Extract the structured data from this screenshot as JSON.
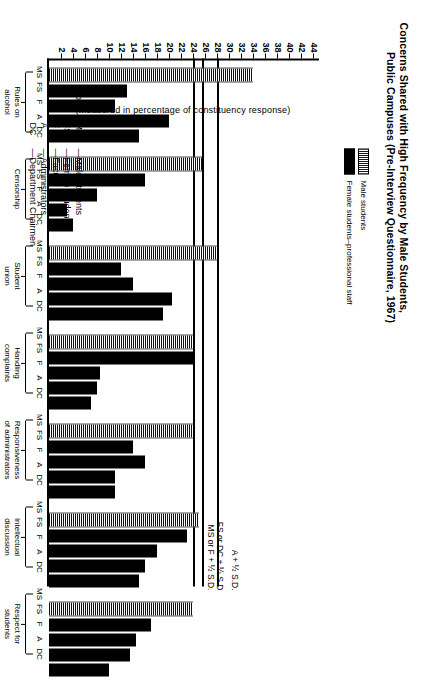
{
  "title": {
    "line1": "Concerns Shared with High Frequency by Male Students,",
    "line2": "Public Campuses (Pre-Interview Questionnaire, 1967)"
  },
  "legend": {
    "items": [
      {
        "label": "Male students",
        "pattern": "striped"
      },
      {
        "label": "Female students–professional staff",
        "pattern": "solid"
      }
    ]
  },
  "axis": {
    "caption": "(Measured in percentage of constituency response)",
    "ticks": [
      2,
      4,
      6,
      8,
      10,
      12,
      14,
      16,
      18,
      20,
      22,
      24,
      26,
      28,
      30,
      32,
      34,
      36,
      38,
      40,
      42,
      44
    ]
  },
  "reference_lines": [
    {
      "label": "MS or F + ½ S.D.",
      "value": 24
    },
    {
      "label": "FS or DC + ½ S.D",
      "value": 25.5
    },
    {
      "label": "A + ½ S.D.",
      "value": 28
    }
  ],
  "code_key": {
    "heading": "Code:",
    "entries": [
      {
        "abbr": "MS",
        "dash": "—",
        "name": "Male Students"
      },
      {
        "abbr": "FS",
        "dash": "—",
        "name": "Female Students"
      },
      {
        "abbr": "F",
        "dash": "—",
        "name": "Faculty"
      },
      {
        "abbr": "A",
        "dash": "—",
        "name": "Administrators"
      },
      {
        "abbr": "DC",
        "dash": "—",
        "name": "Department Chairmen"
      }
    ]
  },
  "chart_data": {
    "type": "bar",
    "title": "Concerns Shared with High Frequency by Male Students, Public Campuses (Pre-Interview Questionnaire, 1967)",
    "xlabel": "",
    "ylabel": "(Measured in percentage of constituency response)",
    "ylim": [
      0,
      45
    ],
    "grid": false,
    "legend_position": "top-left",
    "constituencies": [
      "MS",
      "FS",
      "F",
      "A",
      "DC"
    ],
    "categories": [
      "Rules on alcohol",
      "Censorship",
      "Student union",
      "Handling complaints",
      "Responsiveness of administrators",
      "Intellectual discussion",
      "Respect for students"
    ],
    "groups": [
      {
        "name": "Rules on\nalcohol",
        "name_line1": "Rules on",
        "name_line2": "alcohol",
        "codes": [
          "MS",
          "FS",
          "F",
          "A",
          "DC"
        ],
        "values": [
          34,
          13,
          11,
          20,
          15
        ]
      },
      {
        "name": "Censorship",
        "name_line1": "Censorship",
        "name_line2": "",
        "codes": [
          "MS",
          "FS",
          "F",
          "A",
          "DC"
        ],
        "values": [
          25.5,
          16,
          8,
          3,
          4
        ]
      },
      {
        "name": "Student\nunion",
        "name_line1": "Student",
        "name_line2": "union",
        "codes": [
          "MS",
          "FS",
          "F",
          "A",
          "DC"
        ],
        "values": [
          28,
          12,
          14,
          20.5,
          19
        ]
      },
      {
        "name": "Handling\ncomplaints",
        "name_line1": "Handling",
        "name_line2": "complaints",
        "codes": [
          "MS",
          "FS",
          "F",
          "A",
          "DC"
        ],
        "values": [
          24,
          24,
          8.5,
          8,
          7
        ]
      },
      {
        "name": "Responsiveness\nof administrators",
        "name_line1": "Responsiveness",
        "name_line2": "of administrators",
        "codes": [
          "MS",
          "FS",
          "F",
          "A",
          "DC"
        ],
        "values": [
          24,
          14,
          16,
          11,
          11
        ]
      },
      {
        "name": "Intellectual\ndiscussion",
        "name_line1": "Intellectual",
        "name_line2": "discussion",
        "codes": [
          "MS",
          "FS",
          "F",
          "A",
          "DC"
        ],
        "values": [
          25,
          23,
          18,
          16,
          15
        ]
      },
      {
        "name": "Respect for\nstudents",
        "name_line1": "Respect for",
        "name_line2": "students",
        "codes": [
          "MS",
          "FS",
          "F",
          "A",
          "DC"
        ],
        "values": [
          24,
          17,
          14.5,
          13.5,
          10
        ]
      }
    ],
    "reference_lines": [
      {
        "label": "MS or F + ½ S.D.",
        "value": 24
      },
      {
        "label": "FS or DC + ½ S.D",
        "value": 25.5
      },
      {
        "label": "A + ½ S.D.",
        "value": 28
      }
    ]
  }
}
